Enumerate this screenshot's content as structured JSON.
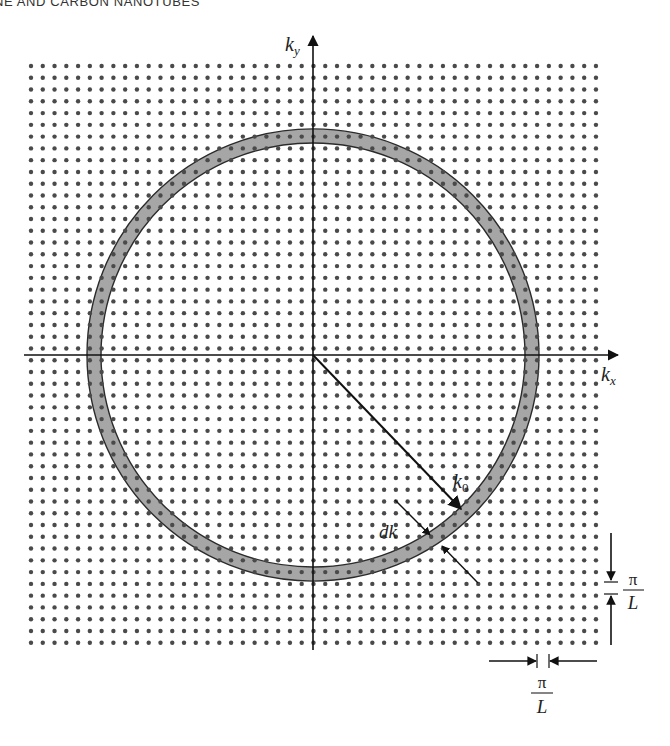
{
  "page": {
    "running_head": "NE AND CARBON NANOTUBES"
  },
  "figure": {
    "axes": {
      "x_label": "k",
      "x_subscript": "x",
      "y_label": "k",
      "y_subscript": "y"
    },
    "grid": {
      "x_start": 31,
      "y_start": 66,
      "spacing": 11.77,
      "columns": 49,
      "rows": 50,
      "dot_radius": 2.2,
      "dot_color": "#4a4a4a"
    },
    "origin": {
      "x": 313,
      "y": 355
    },
    "shell": {
      "outer_radius": 226,
      "inner_radius": 212,
      "fill_color": "#a6a6a6",
      "edge_color": "#2b2b2b"
    },
    "labels": {
      "radius": {
        "text": "k",
        "subscript": "0"
      },
      "thickness": {
        "text": "dk"
      },
      "spacing_vertical": {
        "numerator": "π",
        "denominator": "L"
      },
      "spacing_horizontal": {
        "numerator": "π",
        "denominator": "L"
      }
    }
  }
}
